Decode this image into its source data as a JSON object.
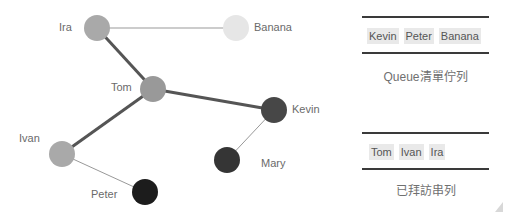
{
  "graph": {
    "nodes": [
      {
        "id": "ira",
        "label": "Ira",
        "x": 97,
        "y": 28,
        "color": "#a9a9a9",
        "label_x": 59,
        "label_y": 21
      },
      {
        "id": "banana",
        "label": "Banana",
        "x": 236,
        "y": 28,
        "color": "#e6e6e6",
        "label_x": 254,
        "label_y": 21
      },
      {
        "id": "tom",
        "label": "Tom",
        "x": 153,
        "y": 89,
        "color": "#999999",
        "label_x": 111,
        "label_y": 81
      },
      {
        "id": "kevin",
        "label": "Kevin",
        "x": 274,
        "y": 110,
        "color": "#474747",
        "label_x": 292,
        "label_y": 103
      },
      {
        "id": "ivan",
        "label": "Ivan",
        "x": 62,
        "y": 154,
        "color": "#a9a9a9",
        "label_x": 19,
        "label_y": 132
      },
      {
        "id": "mary",
        "label": "Mary",
        "x": 227,
        "y": 160,
        "color": "#353535",
        "label_x": 261,
        "label_y": 157
      },
      {
        "id": "peter",
        "label": "Peter",
        "x": 145,
        "y": 192,
        "color": "#1c1c1c",
        "label_x": 91,
        "label_y": 188
      }
    ],
    "edges": [
      {
        "from": "ira",
        "to": "banana",
        "weight": "thin"
      },
      {
        "from": "ira",
        "to": "tom",
        "weight": "thick"
      },
      {
        "from": "tom",
        "to": "kevin",
        "weight": "thick"
      },
      {
        "from": "tom",
        "to": "ivan",
        "weight": "thick"
      },
      {
        "from": "ivan",
        "to": "peter",
        "weight": "thin"
      },
      {
        "from": "kevin",
        "to": "mary",
        "weight": "thin"
      }
    ]
  },
  "queue": {
    "items": [
      "Kevin",
      "Peter",
      "Banana"
    ],
    "caption": "Queue清單佇列"
  },
  "visited": {
    "items": [
      "Tom",
      "Ivan",
      "Ira"
    ],
    "caption": "已拜訪串列"
  },
  "colors": {
    "thick_edge": "#555555",
    "thin_edge": "#999999",
    "divider": "#3a3a3a",
    "chip_bg": "#e9e9e9"
  }
}
